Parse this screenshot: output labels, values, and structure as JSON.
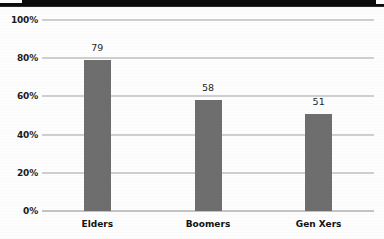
{
  "chart_data": {
    "type": "bar",
    "title": "",
    "xlabel": "",
    "ylabel": "",
    "categories": [
      "Elders",
      "Boomers",
      "Gen Xers"
    ],
    "values": [
      79,
      58,
      51
    ],
    "value_labels": [
      "79",
      "58",
      "51"
    ],
    "ylim": [
      0,
      100
    ],
    "ytick_labels": [
      "0%",
      "20%",
      "40%",
      "60%",
      "80%",
      "100%"
    ],
    "ytick_values": [
      0,
      20,
      40,
      60,
      80,
      100
    ],
    "grid": true,
    "grid_axis": "y",
    "legend": false,
    "legend_position": "none",
    "series": [
      {
        "name": "",
        "values": [
          79,
          58,
          51
        ]
      }
    ],
    "colors": {
      "bar": "#6e6e6e",
      "gridline": "#cfcfcf",
      "background": "#fdfdfd",
      "text": "#1a1a1a",
      "top_band": "#0c0c0c"
    }
  }
}
